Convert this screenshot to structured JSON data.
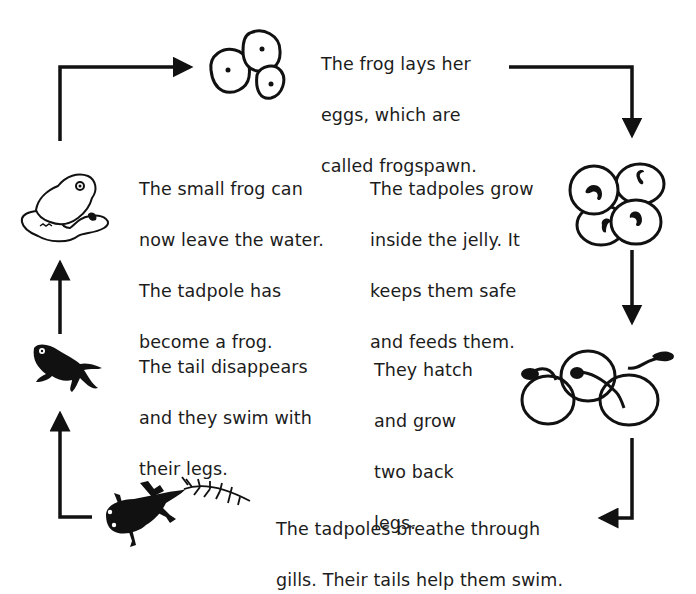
{
  "colors": {
    "ink": "#111111",
    "text": "#1c1c1c",
    "background": "#ffffff"
  },
  "stages": [
    {
      "id": "frogspawn",
      "illustration": "frogspawn-icon",
      "lines": [
        "The frog lays her",
        "eggs, which are",
        "called frogspawn."
      ]
    },
    {
      "id": "embryo",
      "illustration": "embryo-in-jelly-icon",
      "lines": [
        "The tadpoles grow",
        "inside the jelly. It",
        "keeps them safe",
        "and feeds them."
      ]
    },
    {
      "id": "hatching",
      "illustration": "hatching-tadpoles-icon",
      "lines": [
        "They hatch",
        "and grow",
        "two back",
        "legs."
      ]
    },
    {
      "id": "gills",
      "illustration": "tadpole-with-gills-icon",
      "lines": [
        "The tadpoles breathe through",
        "gills. Their tails help them swim."
      ]
    },
    {
      "id": "froglet",
      "illustration": "froglet-icon",
      "lines": [
        "The tail disappears",
        "and they swim with",
        "their legs."
      ]
    },
    {
      "id": "frog",
      "illustration": "frog-on-lily-pad-icon",
      "lines": [
        "The small frog can",
        "now leave the water.",
        "The tadpole has",
        "become a frog."
      ]
    }
  ],
  "cycle_order": [
    "frogspawn",
    "embryo",
    "hatching",
    "gills",
    "froglet",
    "frog"
  ]
}
